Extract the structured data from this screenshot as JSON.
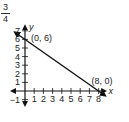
{
  "corner_fraction": {
    "numerator": "3",
    "denominator": "4"
  },
  "chart_data": {
    "type": "line",
    "title": "",
    "xlabel": "x",
    "ylabel": "y",
    "xlim": [
      -1,
      8
    ],
    "ylim": [
      -1,
      7
    ],
    "x_ticks": [
      "1",
      "2",
      "3",
      "4",
      "5",
      "6",
      "7",
      "8"
    ],
    "y_ticks": [
      "-1",
      "1",
      "2",
      "3",
      "4",
      "5",
      "6",
      "7"
    ],
    "grid": false,
    "series": [
      {
        "name": "line",
        "x": [
          0,
          8
        ],
        "y": [
          6,
          0
        ]
      }
    ],
    "annotations": [
      {
        "text": "(0, 6)",
        "x": 0,
        "y": 6
      },
      {
        "text": "(8, 0)",
        "x": 8,
        "y": 0
      }
    ]
  }
}
